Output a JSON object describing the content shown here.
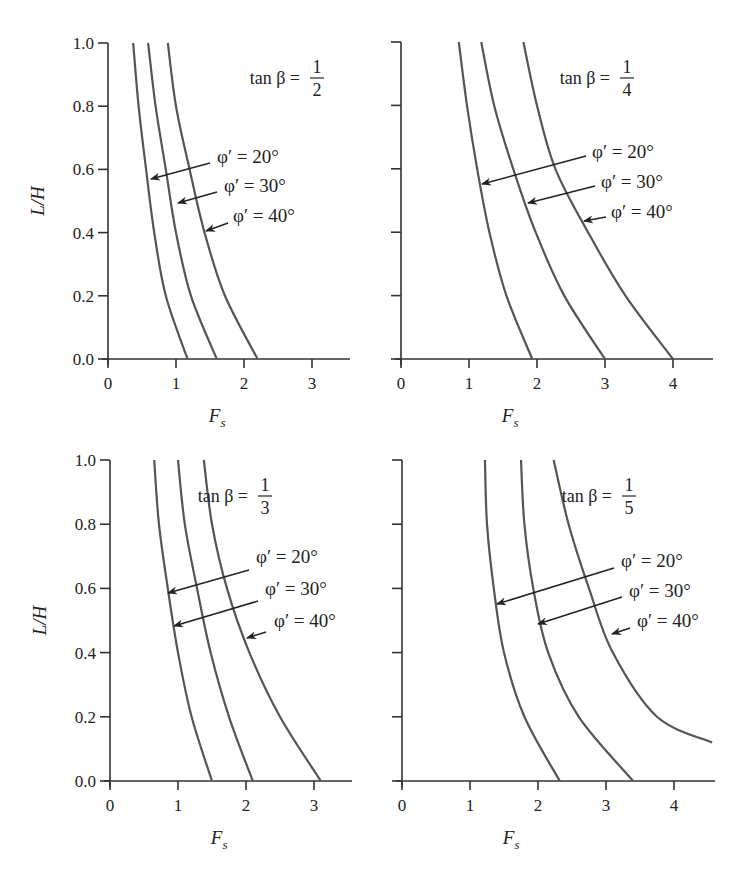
{
  "chart_data": [
    {
      "type": "line",
      "title": "tan β = 1/2",
      "annotation": {
        "prefix": "tan β =",
        "numerator": "1",
        "denominator": "2"
      },
      "xlabel": "F_s",
      "ylabel": "L/H",
      "xlim": [
        0,
        3.5
      ],
      "ylim": [
        0,
        1.0
      ],
      "xticks": [
        "0",
        "1",
        "2",
        "3"
      ],
      "yticks": [
        "0.0",
        "0.2",
        "0.4",
        "0.6",
        "0.8",
        "1.0"
      ],
      "grid": false,
      "series": [
        {
          "name": "φ′ = 20°",
          "x": [
            0.37,
            0.45,
            0.56,
            0.68,
            0.85,
            1.17
          ],
          "y": [
            1.0,
            0.8,
            0.6,
            0.4,
            0.2,
            0.0
          ]
        },
        {
          "name": "φ′ = 30°",
          "x": [
            0.59,
            0.7,
            0.85,
            1.0,
            1.22,
            1.6
          ],
          "y": [
            1.0,
            0.8,
            0.6,
            0.4,
            0.2,
            0.0
          ]
        },
        {
          "name": "φ′ = 40°",
          "x": [
            0.88,
            1.0,
            1.2,
            1.42,
            1.72,
            2.2
          ],
          "y": [
            1.0,
            0.8,
            0.6,
            0.4,
            0.2,
            0.0
          ]
        }
      ]
    },
    {
      "type": "line",
      "title": "tan β = 1/4",
      "annotation": {
        "prefix": "tan β =",
        "numerator": "1",
        "denominator": "4"
      },
      "xlabel": "F_s",
      "ylabel": "",
      "xlim": [
        0,
        4.6
      ],
      "ylim": [
        0,
        1.0
      ],
      "xticks": [
        "0",
        "1",
        "2",
        "3",
        "4"
      ],
      "yticks": [],
      "grid": false,
      "series": [
        {
          "name": "φ′ = 20°",
          "x": [
            0.85,
            0.97,
            1.12,
            1.3,
            1.55,
            1.93
          ],
          "y": [
            1.0,
            0.8,
            0.6,
            0.4,
            0.2,
            0.0
          ]
        },
        {
          "name": "φ′ = 30°",
          "x": [
            1.18,
            1.37,
            1.65,
            1.98,
            2.4,
            3.0
          ],
          "y": [
            1.0,
            0.8,
            0.6,
            0.4,
            0.2,
            0.0
          ]
        },
        {
          "name": "φ′ = 40°",
          "x": [
            1.8,
            2.0,
            2.27,
            2.75,
            3.3,
            4.0
          ],
          "y": [
            1.0,
            0.8,
            0.6,
            0.4,
            0.2,
            0.0
          ]
        }
      ]
    },
    {
      "type": "line",
      "title": "tan β = 1/3",
      "annotation": {
        "prefix": "tan β =",
        "numerator": "1",
        "denominator": "3"
      },
      "xlabel": "F_s",
      "ylabel": "L/H",
      "xlim": [
        0,
        3.5
      ],
      "ylim": [
        0,
        1.0
      ],
      "xticks": [
        "0",
        "1",
        "2",
        "3"
      ],
      "yticks": [
        "0.0",
        "0.2",
        "0.4",
        "0.6",
        "0.8",
        "1.0"
      ],
      "grid": false,
      "series": [
        {
          "name": "φ′ = 20°",
          "x": [
            0.65,
            0.72,
            0.85,
            1.0,
            1.2,
            1.5
          ],
          "y": [
            1.0,
            0.8,
            0.6,
            0.4,
            0.2,
            0.0
          ]
        },
        {
          "name": "φ′ = 30°",
          "x": [
            1.0,
            1.1,
            1.28,
            1.48,
            1.75,
            2.1
          ],
          "y": [
            1.0,
            0.8,
            0.6,
            0.4,
            0.2,
            0.0
          ]
        },
        {
          "name": "φ′ = 40°",
          "x": [
            1.38,
            1.5,
            1.72,
            2.05,
            2.5,
            3.1
          ],
          "y": [
            1.0,
            0.8,
            0.6,
            0.4,
            0.2,
            0.0
          ]
        }
      ]
    },
    {
      "type": "line",
      "title": "tan β = 1/5",
      "annotation": {
        "prefix": "tan β =",
        "numerator": "1",
        "denominator": "5"
      },
      "xlabel": "F_s",
      "ylabel": "",
      "xlim": [
        0,
        4.6
      ],
      "ylim": [
        0,
        1.0
      ],
      "xticks": [
        "0",
        "1",
        "2",
        "3",
        "4"
      ],
      "yticks": [],
      "grid": false,
      "series": [
        {
          "name": "φ′ = 20°",
          "x": [
            1.22,
            1.25,
            1.35,
            1.5,
            1.8,
            2.32
          ],
          "y": [
            1.0,
            0.8,
            0.6,
            0.4,
            0.2,
            0.0
          ]
        },
        {
          "name": "φ′ = 30°",
          "x": [
            1.75,
            1.8,
            1.93,
            2.15,
            2.6,
            3.4
          ],
          "y": [
            1.0,
            0.8,
            0.6,
            0.4,
            0.2,
            0.0
          ]
        },
        {
          "name": "φ′ = 40°",
          "x": [
            2.23,
            2.45,
            2.75,
            3.1,
            3.75,
            4.56
          ],
          "y": [
            1.0,
            0.8,
            0.6,
            0.4,
            0.2,
            0.12
          ]
        }
      ]
    }
  ],
  "labels": {
    "phi20": "φ′ = 20°",
    "phi30": "φ′ = 30°",
    "phi40": "φ′ = 40°",
    "xaxis": "F",
    "xaxis_sub": "s",
    "yaxis": "L/H"
  }
}
